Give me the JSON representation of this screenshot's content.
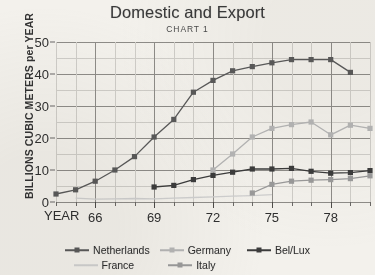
{
  "chart_data": {
    "type": "line",
    "title": "Domestic and Export",
    "subtitle": "CHART 1",
    "xlabel": "YEAR",
    "ylabel": "BILLIONS CUBIC METERS per YEAR",
    "ylim": [
      0,
      50
    ],
    "yticks": [
      0,
      10,
      20,
      30,
      40,
      50
    ],
    "y_minor_step": 5,
    "xlim": [
      1964,
      1980
    ],
    "xticks": [
      66,
      69,
      72,
      75,
      78
    ],
    "xtick_values": [
      1966,
      1969,
      1972,
      1975,
      1978
    ],
    "x_minor_step": 1,
    "grid": true,
    "legend_position": "bottom",
    "x": [
      1964,
      1965,
      1966,
      1967,
      1968,
      1969,
      1970,
      1971,
      1972,
      1973,
      1974,
      1975,
      1976,
      1977,
      1978,
      1979,
      1980
    ],
    "series": [
      {
        "name": "Netherlands",
        "color": "#5a5a5a",
        "marker": "square",
        "values": [
          2.5,
          3.8,
          6.5,
          10.0,
          14.2,
          20.3,
          25.8,
          34.3,
          38.0,
          41.0,
          42.3,
          43.5,
          44.5,
          44.5,
          44.5,
          40.5,
          null
        ]
      },
      {
        "name": "Germany",
        "color": "#b5b5b5",
        "marker": "square",
        "values": [
          null,
          null,
          null,
          null,
          null,
          null,
          null,
          null,
          10.0,
          15.0,
          20.3,
          23.0,
          24.2,
          25.0,
          21.0,
          24.0,
          23.0
        ]
      },
      {
        "name": "Bel/Lux",
        "color": "#3c3c3c",
        "marker": "square",
        "values": [
          null,
          null,
          null,
          null,
          null,
          4.7,
          5.2,
          7.0,
          8.3,
          9.3,
          10.3,
          10.3,
          10.5,
          9.6,
          9.0,
          9.2,
          9.8
        ]
      },
      {
        "name": "France",
        "color": "#cfcfcf",
        "marker": "none",
        "values": [
          null,
          1.2,
          0.9,
          1.0,
          1.1,
          1.0,
          1.2,
          1.4,
          1.6,
          1.8,
          2.0,
          2.3,
          null,
          null,
          null,
          null,
          null
        ]
      },
      {
        "name": "Italy",
        "color": "#9a9a9a",
        "marker": "square",
        "values": [
          null,
          null,
          null,
          null,
          null,
          null,
          null,
          null,
          null,
          null,
          2.8,
          5.5,
          6.5,
          6.8,
          7.0,
          7.3,
          8.2
        ]
      }
    ]
  },
  "legend": {
    "row1": [
      "Netherlands",
      "Germany",
      "Bel/Lux"
    ],
    "row2": [
      "France",
      "Italy"
    ]
  },
  "colors": {
    "background": "#f3f1ec",
    "grid_major": "#8e8c88",
    "grid_minor": "#cfcdc8",
    "text": "#2f2f2f"
  }
}
